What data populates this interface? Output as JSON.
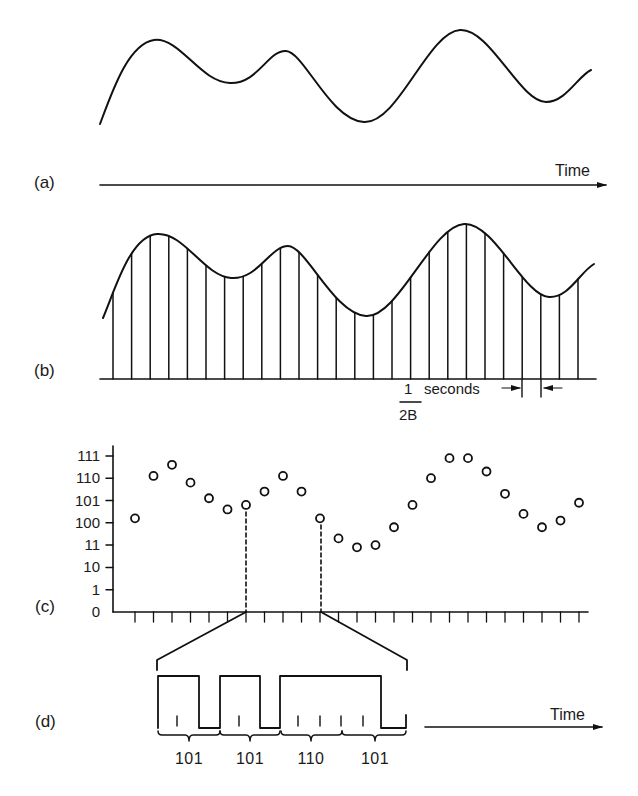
{
  "panels": {
    "a": {
      "label": "(a)",
      "axis_label": "Time",
      "description": "Continuous analog signal"
    },
    "b": {
      "label": "(b)",
      "sample_interval": {
        "numerator": "1",
        "denominator": "2B",
        "unit": "seconds"
      },
      "sample_count": 26
    },
    "c": {
      "label": "(c)",
      "y_ticks": [
        "0",
        "1",
        "10",
        "11",
        "100",
        "101",
        "110",
        "111"
      ],
      "x_tick_count": 25
    },
    "d": {
      "label": "(d)",
      "axis_label": "Time",
      "codes": [
        "101",
        "101",
        "110",
        "101"
      ]
    }
  },
  "colors": {
    "ink": "#111111",
    "background": "#ffffff"
  },
  "chart_data": {
    "type": "scatter",
    "title": "",
    "xlabel": "Time",
    "ylabel": "Quantized level (binary)",
    "y_tick_labels": [
      "0",
      "1",
      "10",
      "11",
      "100",
      "101",
      "110",
      "111"
    ],
    "ylim": [
      0,
      7
    ],
    "points": [
      {
        "x": 1,
        "y": 4.2
      },
      {
        "x": 2,
        "y": 6.1
      },
      {
        "x": 3,
        "y": 6.6
      },
      {
        "x": 4,
        "y": 5.8
      },
      {
        "x": 5,
        "y": 5.1
      },
      {
        "x": 6,
        "y": 4.6
      },
      {
        "x": 7,
        "y": 4.8
      },
      {
        "x": 8,
        "y": 5.4
      },
      {
        "x": 9,
        "y": 6.1
      },
      {
        "x": 10,
        "y": 5.4
      },
      {
        "x": 11,
        "y": 4.2
      },
      {
        "x": 12,
        "y": 3.3
      },
      {
        "x": 13,
        "y": 2.9
      },
      {
        "x": 14,
        "y": 3.0
      },
      {
        "x": 15,
        "y": 3.8
      },
      {
        "x": 16,
        "y": 4.8
      },
      {
        "x": 17,
        "y": 6.0
      },
      {
        "x": 18,
        "y": 6.9
      },
      {
        "x": 19,
        "y": 6.9
      },
      {
        "x": 20,
        "y": 6.3
      },
      {
        "x": 21,
        "y": 5.3
      },
      {
        "x": 22,
        "y": 4.4
      },
      {
        "x": 23,
        "y": 3.8
      },
      {
        "x": 24,
        "y": 4.1
      },
      {
        "x": 25,
        "y": 4.9
      }
    ],
    "encoded_samples": [
      {
        "sample": 7,
        "code": "101"
      },
      {
        "sample": 11,
        "code": "100"
      }
    ],
    "bit_stream": [
      "101",
      "101",
      "110",
      "101"
    ]
  }
}
